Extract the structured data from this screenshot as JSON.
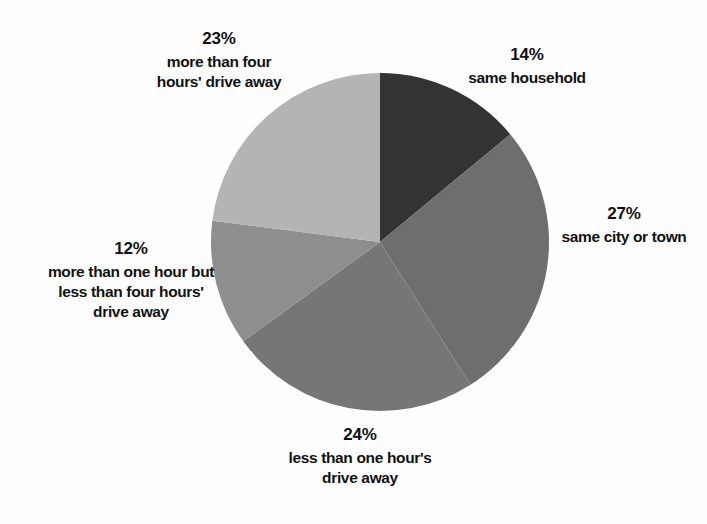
{
  "chart_data": {
    "type": "pie",
    "title": "",
    "subtitle": "",
    "xlabel": "",
    "ylabel": "",
    "legend_position": "none",
    "grid": false,
    "units": "percent",
    "start_angle_deg": 0,
    "direction": "clockwise",
    "categories": [
      "same household",
      "same city or town",
      "less than one hour's drive away",
      "more than one hour but less than four hours' drive away",
      "more than four hours' drive away"
    ],
    "values": [
      14,
      27,
      24,
      12,
      23
    ],
    "colors": [
      "#333333",
      "#6e6e6e",
      "#767676",
      "#8e8e8e",
      "#b4b4b4"
    ],
    "slices": [
      {
        "percent_label": "14%",
        "value": 14,
        "label_lines": "same household",
        "color": "#333333",
        "start_deg": 0,
        "end_deg": 50.4
      },
      {
        "percent_label": "27%",
        "value": 27,
        "label_lines": "same city or town",
        "color": "#6e6e6e",
        "start_deg": 50.4,
        "end_deg": 147.6
      },
      {
        "percent_label": "24%",
        "value": 24,
        "label_lines": "less than one hour's\ndrive away",
        "color": "#767676",
        "start_deg": 147.6,
        "end_deg": 234.0
      },
      {
        "percent_label": "12%",
        "value": 12,
        "label_lines": "more than one hour but\nless than four hours'\ndrive away",
        "color": "#8e8e8e",
        "start_deg": 234.0,
        "end_deg": 277.2
      },
      {
        "percent_label": "23%",
        "value": 23,
        "label_lines": "more than four\nhours' drive away",
        "color": "#b4b4b4",
        "start_deg": 277.2,
        "end_deg": 360.0
      }
    ]
  },
  "background_color": "#fefefe"
}
